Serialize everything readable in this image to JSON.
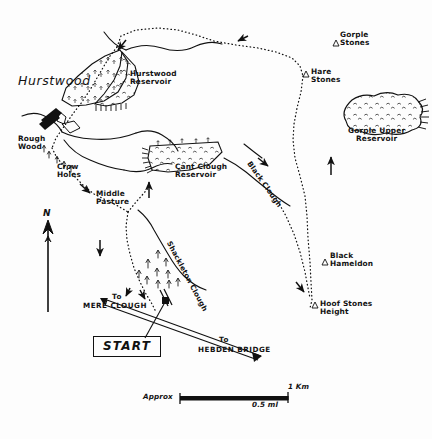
{
  "map": {
    "title": "Hurstwood / Gorple moorland walk sketch map",
    "background_color": "#fdfdfd",
    "ink_color": "#111111",
    "settlements": [
      {
        "name": "hurstwood",
        "label": "Hurstwood",
        "x": 18,
        "y": 80
      }
    ],
    "reservoirs": [
      {
        "name": "hurstwood-reservoir",
        "label": "Hurstwood\nReservoir",
        "x": 130,
        "y": 74
      },
      {
        "name": "cant-clough-reservoir",
        "label": "Cant Clough\nReservoir",
        "x": 186,
        "y": 168
      },
      {
        "name": "gorple-upper-reservoir",
        "label": "Gorple Upper\nReservoir",
        "x": 352,
        "y": 126
      }
    ],
    "places": [
      {
        "name": "rough-wood",
        "label": "Rough\nWood",
        "x": 22,
        "y": 139
      },
      {
        "name": "crow-holes",
        "label": "Crow\nHoles",
        "x": 57,
        "y": 166
      },
      {
        "name": "middle-pasture",
        "label": "Middle\nPasture",
        "x": 97,
        "y": 193
      }
    ],
    "summits": [
      {
        "name": "gorple-stones",
        "label": "Gorple\nStones",
        "x": 338,
        "y": 34,
        "marker_x": 333,
        "marker_y": 43
      },
      {
        "name": "hare-stones",
        "label": "Hare\nStones",
        "x": 310,
        "y": 73,
        "marker_x": 303,
        "marker_y": 74
      },
      {
        "name": "black-hameldon",
        "label": "Black\nHameldon",
        "x": 329,
        "y": 253,
        "marker_x": 322,
        "marker_y": 262
      },
      {
        "name": "hoof-stones-height",
        "label": "Hoof Stones\nHeight",
        "x": 318,
        "y": 303,
        "marker_x": 312,
        "marker_y": 305
      }
    ],
    "valleys": [
      {
        "name": "black-clough",
        "label": "Black Clough",
        "x": 253,
        "y": 163
      },
      {
        "name": "shackleton-clough",
        "label": "Shackleton Clough",
        "x": 172,
        "y": 252
      }
    ],
    "directions": [
      {
        "name": "to-mere-clough",
        "line1": "To",
        "line2": "MERE CLOUGH",
        "x": 104,
        "y": 297
      },
      {
        "name": "to-hebden-bridge",
        "line1": "To",
        "line2": "HEBDEN BRIDGE",
        "x": 199,
        "y": 338
      }
    ],
    "start_marker": {
      "label": "START",
      "x": 93,
      "y": 338
    },
    "north_arrow": {
      "label": "N",
      "x": 44,
      "y": 209
    },
    "scale_bar": {
      "prefix": "Approx",
      "upper_label": "1 Km",
      "lower_label": "0.5 ml",
      "x": 143,
      "y": 392
    },
    "route_style": "dotted",
    "road_style": "double-line"
  }
}
